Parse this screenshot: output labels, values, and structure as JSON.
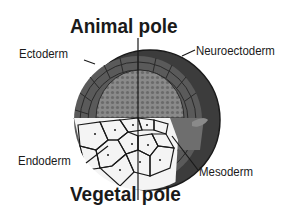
{
  "diagram": {
    "title_top": "Animal pole",
    "title_bottom": "Vegetal pole",
    "labels": {
      "ectoderm": "Ectoderm",
      "neuroectoderm": "Neuroectoderm",
      "endoderm": "Endoderm",
      "mesoderm": "Mesoderm"
    },
    "colors": {
      "outer_shell": "#3c3c3c",
      "ectoderm_cells": "#5a5a5a",
      "inner_dome": "#8a8a8a",
      "mesoderm_cells": "#6e6e6e",
      "endoderm_cells": "#f4f4f4",
      "outline": "#1a1a1a"
    }
  }
}
